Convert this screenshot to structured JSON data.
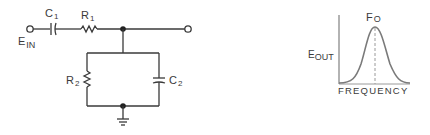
{
  "circuit": {
    "input_label": "E",
    "input_sub": "IN",
    "c1_label": "C",
    "c1_sub": "1",
    "r1_label": "R",
    "r1_sub": "1",
    "r2_label": "R",
    "r2_sub": "2",
    "c2_label": "C",
    "c2_sub": "2"
  },
  "graph": {
    "y_label": "E",
    "y_sub": "OUT",
    "x_label": "FREQUENCY",
    "peak_label": "F",
    "peak_sub": "O"
  },
  "colors": {
    "line": "#3a3a3a",
    "curve": "#7a7a7a",
    "axis": "#8a8a8a"
  }
}
